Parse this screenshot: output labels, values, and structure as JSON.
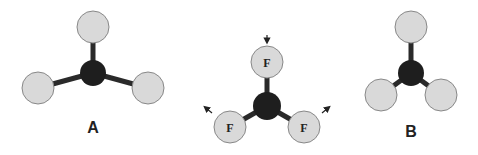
{
  "diagram": {
    "molecule_a": {
      "label": "A"
    },
    "molecule_middle": {
      "atom_labels": [
        "F",
        "F",
        "F"
      ]
    },
    "molecule_b": {
      "label": "B"
    }
  },
  "colors": {
    "outer_atom": "#d9d9d9",
    "central_atom": "#1e1e1e",
    "bond": "#2a2a2a"
  }
}
